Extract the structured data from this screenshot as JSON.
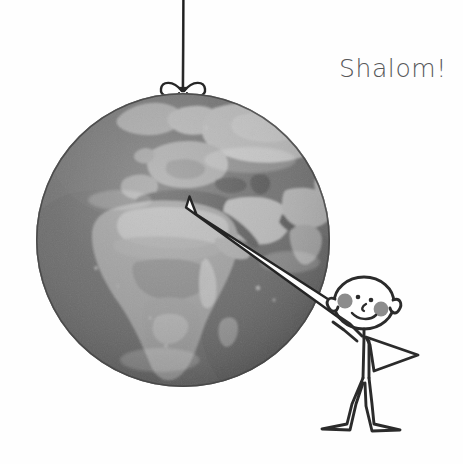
{
  "illustration": {
    "title": "Stick figure pointing at a hanging globe",
    "background_color": "#fefefe",
    "width": 463,
    "height": 464
  },
  "greeting": {
    "text": "Shalom!",
    "color": "#57585a",
    "position": {
      "x": 339,
      "y": 56
    }
  },
  "globe": {
    "name": "earth-globe",
    "center": {
      "x": 183,
      "y": 240
    },
    "radius": 147,
    "ocean_color": "#6e6e6e",
    "ocean_color_dark": "#5d5d5d",
    "land_color": "#9b9b9b",
    "land_color_light": "#b4b4b4",
    "land_color_dark": "#808080",
    "outline_color": "#4a4a4a",
    "visible_regions": [
      "Europe",
      "Africa",
      "Middle East",
      "Mediterranean Sea",
      "Atlantic Ocean",
      "Indian Ocean",
      "Arabian Peninsula",
      "Madagascar",
      "Scandinavia",
      "Greenland"
    ]
  },
  "hanging_string": {
    "name": "hanging-string",
    "color": "#3a3a3a",
    "top": {
      "x": 183,
      "y": 0
    },
    "bottom": {
      "x": 183,
      "y": 90
    },
    "knot": "bow"
  },
  "bow": {
    "name": "string-bow-knot",
    "color": "#2e2e2e",
    "center": {
      "x": 183,
      "y": 91
    },
    "loops": 2
  },
  "pointer": {
    "name": "pointer-stick",
    "fill_color": "#fdfdfd",
    "outline_color": "#242424",
    "tip": {
      "x": 189,
      "y": 197
    },
    "base": {
      "x": 352,
      "y": 312
    },
    "target_label": "Middle East / Israel"
  },
  "figure": {
    "name": "stick-figure-person",
    "line_color": "#2b2b2b",
    "fill_color": "#ffffff",
    "cheek_color": "#8c8c8c",
    "head": {
      "cx": 364,
      "cy": 303,
      "rx": 30,
      "ry": 26
    },
    "eyes": 2,
    "mouth": "smile",
    "cheeks": 2,
    "arms": {
      "raised": "left-arm-holding-pointer",
      "bent": "right-arm-on-hip"
    },
    "legs": 2,
    "feet": 2,
    "bounds": {
      "x": 318,
      "y": 265,
      "width": 112,
      "height": 165
    }
  }
}
